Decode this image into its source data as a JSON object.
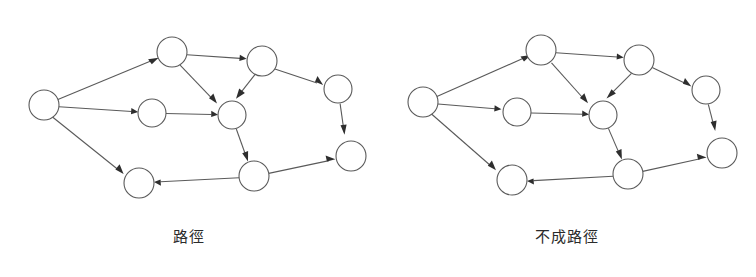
{
  "figure": {
    "background_color": "#ffffff",
    "stroke_color": "#5a5a5a",
    "arrow_color": "#2e2e2e",
    "panels": [
      {
        "id": "path-diagram",
        "caption": "路徑",
        "graph": {
          "type": "directed-graph",
          "node_radius": 15,
          "nodes": [
            {
              "id": "n0",
              "cx": 44,
              "cy": 105
            },
            {
              "id": "n1",
              "cx": 172,
              "cy": 52
            },
            {
              "id": "n2",
              "cx": 152,
              "cy": 113
            },
            {
              "id": "n3",
              "cx": 232,
              "cy": 115
            },
            {
              "id": "n4",
              "cx": 262,
              "cy": 61
            },
            {
              "id": "n5",
              "cx": 338,
              "cy": 89
            },
            {
              "id": "n6",
              "cx": 351,
              "cy": 156
            },
            {
              "id": "n7",
              "cx": 254,
              "cy": 176
            },
            {
              "id": "n8",
              "cx": 139,
              "cy": 183
            }
          ],
          "edges": [
            {
              "from": "n0",
              "to": "n1"
            },
            {
              "from": "n0",
              "to": "n2"
            },
            {
              "from": "n0",
              "to": "n8"
            },
            {
              "from": "n1",
              "to": "n4"
            },
            {
              "from": "n1",
              "to": "n3"
            },
            {
              "from": "n2",
              "to": "n3"
            },
            {
              "from": "n4",
              "to": "n3"
            },
            {
              "from": "n4",
              "to": "n5"
            },
            {
              "from": "n5",
              "to": "n6"
            },
            {
              "from": "n3",
              "to": "n7"
            },
            {
              "from": "n7",
              "to": "n6"
            },
            {
              "from": "n7",
              "to": "n8"
            }
          ]
        }
      },
      {
        "id": "not-path-diagram",
        "caption": "不成路徑",
        "graph": {
          "type": "directed-graph",
          "node_radius": 15,
          "nodes": [
            {
              "id": "m0",
              "cx": 45,
              "cy": 102
            },
            {
              "id": "m1",
              "cx": 163,
              "cy": 50
            },
            {
              "id": "m2",
              "cx": 139,
              "cy": 112
            },
            {
              "id": "m3",
              "cx": 603,
              "cy": 115
            },
            {
              "id": "m4",
              "cx": 639,
              "cy": 60
            },
            {
              "id": "m5",
              "cx": 706,
              "cy": 90
            },
            {
              "id": "m6",
              "cx": 722,
              "cy": 153
            },
            {
              "id": "m7",
              "cx": 628,
              "cy": 174
            },
            {
              "id": "m8",
              "cx": 512,
              "cy": 180
            }
          ],
          "edges": [
            {
              "from": "m0",
              "to": "m1"
            },
            {
              "from": "m0",
              "to": "m2"
            },
            {
              "from": "m0",
              "to": "m8"
            },
            {
              "from": "m1",
              "to": "m4"
            },
            {
              "from": "m1",
              "to": "m3"
            },
            {
              "from": "m2",
              "to": "m3"
            },
            {
              "from": "m4",
              "to": "m3"
            },
            {
              "from": "m4",
              "to": "m5"
            },
            {
              "from": "m5",
              "to": "m6"
            },
            {
              "from": "m3",
              "to": "m7"
            },
            {
              "from": "m7",
              "to": "m6"
            },
            {
              "from": "m7",
              "to": "m8"
            }
          ]
        }
      }
    ]
  }
}
